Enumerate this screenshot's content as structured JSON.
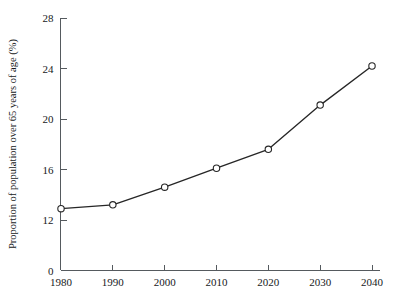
{
  "chart_data": {
    "type": "line",
    "title": "",
    "subtitle": "",
    "xlabel": "",
    "ylabel": "Proportion of population over 65 years of age (%)",
    "x": [
      1980,
      1990,
      2000,
      2010,
      2020,
      2030,
      2040
    ],
    "categories": [
      "1980",
      "1990",
      "2000",
      "2010",
      "2020",
      "2030",
      "2040"
    ],
    "values": [
      12.9,
      13.2,
      14.6,
      16.1,
      17.6,
      21.1,
      24.2
    ],
    "series": [
      {
        "name": "Proportion of population over 65 years of age",
        "values": [
          12.9,
          13.2,
          14.6,
          16.1,
          17.6,
          21.1,
          24.2
        ]
      }
    ],
    "xlim": [
      1980,
      2040
    ],
    "ylim": [
      12,
      28
    ],
    "y_axis_break": true,
    "y_axis_origin_label": "0",
    "yticks": [
      0,
      12,
      16,
      20,
      24,
      28
    ],
    "ytick_labels": [
      "0",
      "12",
      "16",
      "20",
      "24",
      "28"
    ],
    "xticks": [
      1980,
      1990,
      2000,
      2010,
      2020,
      2030,
      2040
    ],
    "xtick_labels": [
      "1980",
      "1990",
      "2000",
      "2010",
      "2020",
      "2030",
      "2040"
    ],
    "grid": false,
    "legend": false,
    "legend_position": "none",
    "marker": "open-circle",
    "line_color": "#262626",
    "marker_fill_color": "#ffffff",
    "marker_edge_color": "#262626",
    "axis_color": "#555a5e",
    "background_color": "#ffffff"
  }
}
